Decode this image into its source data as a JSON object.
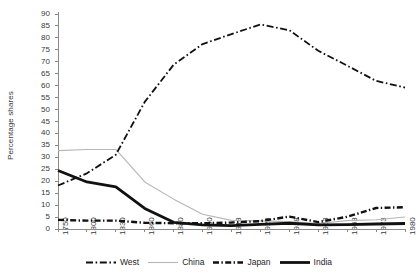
{
  "chart_data": {
    "type": "line",
    "title": "",
    "xlabel": "",
    "ylabel": "Percentage shares",
    "ylim": [
      0,
      90
    ],
    "ytick_step": 5,
    "grid": false,
    "legend_position": "bottom",
    "categories": [
      "1750",
      "1800",
      "1830",
      "1860",
      "1880",
      "1900",
      "1913",
      "1928",
      "1938",
      "1953",
      "1963",
      "1973",
      "1980"
    ],
    "yticks": [
      "0",
      "5",
      "10",
      "15",
      "20",
      "25",
      "30",
      "35",
      "40",
      "45",
      "50",
      "55",
      "60",
      "65",
      "70",
      "75",
      "80",
      "85",
      "90"
    ],
    "series": [
      {
        "name": "West",
        "style": "dash-dot",
        "color": "#111111",
        "width": 1.8,
        "values": [
          18.2,
          23.3,
          31.1,
          53.2,
          68.8,
          77.4,
          81.6,
          85.6,
          83.2,
          74.6,
          68.4,
          62.0,
          59.2
        ]
      },
      {
        "name": "China",
        "style": "solid-thin",
        "color": "#b6b6b6",
        "width": 1.1,
        "values": [
          32.8,
          33.3,
          33.3,
          19.7,
          12.5,
          6.2,
          3.6,
          3.4,
          3.1,
          2.3,
          3.5,
          3.9,
          5.0
        ]
      },
      {
        "name": "Japan",
        "style": "dash-dot-short",
        "color": "#111111",
        "width": 2.4,
        "values": [
          3.8,
          3.5,
          3.5,
          2.6,
          2.4,
          2.4,
          2.7,
          3.3,
          5.2,
          2.9,
          5.1,
          8.8,
          9.1
        ]
      },
      {
        "name": "India",
        "style": "solid-thick",
        "color": "#111111",
        "width": 2.8,
        "values": [
          24.5,
          19.7,
          17.6,
          8.6,
          2.8,
          1.7,
          1.4,
          1.9,
          2.4,
          1.7,
          1.8,
          2.1,
          2.3
        ]
      }
    ]
  },
  "legend": {
    "items": [
      {
        "label": "West"
      },
      {
        "label": "China"
      },
      {
        "label": "Japan"
      },
      {
        "label": "India"
      }
    ]
  }
}
